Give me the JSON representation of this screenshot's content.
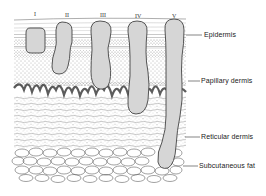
{
  "diagram": {
    "title": "",
    "levels": [
      {
        "numeral": "I",
        "x": 35,
        "y": 12
      },
      {
        "numeral": "II",
        "x": 67,
        "y": 13
      },
      {
        "numeral": "III",
        "x": 103,
        "y": 13
      },
      {
        "numeral": "IV",
        "x": 138,
        "y": 14
      },
      {
        "numeral": "V",
        "x": 174,
        "y": 14
      }
    ],
    "layers": [
      {
        "name": "Epidermis",
        "label_x": 204,
        "label_y": 31,
        "line_from": 186,
        "line_y": 35
      },
      {
        "name": "Papillary dermis",
        "label_x": 201,
        "label_y": 77,
        "line_from": 188,
        "line_y": 81
      },
      {
        "name": "Reticular dermis",
        "label_x": 201,
        "label_y": 133,
        "line_from": 185,
        "line_y": 137
      },
      {
        "name": "Subcutaneous fat",
        "label_x": 199,
        "label_y": 162,
        "line_from": 183,
        "line_y": 166
      }
    ],
    "colors": {
      "outline": "#444444",
      "column_fill": "#d6d6d6",
      "stipple": "#555555",
      "background": "#ffffff"
    }
  }
}
